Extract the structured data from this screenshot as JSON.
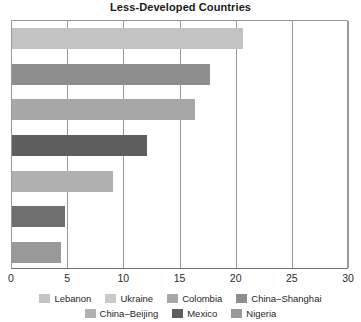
{
  "chart_data": {
    "type": "bar",
    "orientation": "horizontal",
    "title": "Less-Developed Countries",
    "xlabel": "",
    "ylabel": "",
    "xlim": [
      0,
      30
    ],
    "xticks": [
      "0",
      "5",
      "10",
      "15",
      "20",
      "25",
      "30"
    ],
    "xtick_values": [
      0,
      5,
      10,
      15,
      20,
      25,
      30
    ],
    "grid": true,
    "grid_axis": "x",
    "legend_position": "bottom",
    "categories": [
      "Lebanon",
      "Ukraine",
      "Colombia",
      "China–Shanghai",
      "China–Beijing",
      "Mexico",
      "Nigeria"
    ],
    "values": [
      20.6,
      17.6,
      16.3,
      12.0,
      9.0,
      4.7,
      4.4
    ],
    "colors": [
      "#c3c3c3",
      "#8e8e8e",
      "#a7a7a7",
      "#5e5e5e",
      "#b0b0b0",
      "#6f6f6f",
      "#999999"
    ]
  },
  "legend": {
    "rows": [
      [
        {
          "label": "Lebanon",
          "color": "#c3c3c3"
        },
        {
          "label": "Ukraine",
          "color": "#c9c9c9"
        },
        {
          "label": "Colombia",
          "color": "#a7a7a7"
        },
        {
          "label": "China–Shanghai",
          "color": "#8e8e8e"
        }
      ],
      [
        {
          "label": "China–Beijing",
          "color": "#b0b0b0"
        },
        {
          "label": "Mexico",
          "color": "#5e5e5e"
        },
        {
          "label": "Nigeria",
          "color": "#999999"
        }
      ]
    ]
  },
  "axis": {
    "line_color": "#6f6f6f",
    "grid_color": "#9a9a9a"
  }
}
